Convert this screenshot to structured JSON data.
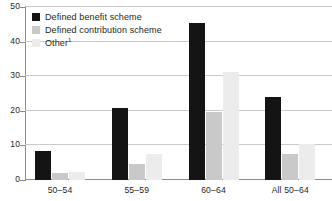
{
  "chart_data": {
    "type": "bar",
    "title": "",
    "subtitle": "",
    "xlabel": "",
    "ylabel": "",
    "ylim": [
      0,
      50
    ],
    "yticks": [
      0,
      10,
      20,
      30,
      40,
      50
    ],
    "ytick_labels": [
      "0",
      "10",
      "20",
      "30",
      "40",
      "50"
    ],
    "grid": true,
    "grid_axis": "y",
    "legend_position": "top-left",
    "categories": [
      "50–54",
      "55–59",
      "60–64",
      "All 50–64"
    ],
    "series": [
      {
        "name": "Defined benefit scheme",
        "color": "#141414",
        "values": [
          8.5,
          20.8,
          45.3,
          24.0
        ]
      },
      {
        "name": "Defined contribution scheme",
        "color": "#c9c9c9",
        "values": [
          2.0,
          4.6,
          19.7,
          7.4
        ]
      },
      {
        "name": "Other",
        "name_suffix": "1",
        "color": "#ececec",
        "values": [
          2.3,
          7.4,
          31.3,
          10.5
        ]
      }
    ]
  },
  "legend": {
    "items": [
      {
        "label": "Defined benefit scheme",
        "suffix": "",
        "swatch": "legend-swatch-dark"
      },
      {
        "label": "Defined contribution scheme",
        "suffix": "",
        "swatch": "legend-swatch-mid-gray"
      },
      {
        "label": "Other",
        "suffix": "1",
        "swatch": "legend-swatch-light-gray"
      }
    ]
  },
  "axes": {
    "y_tick_labels": [
      "50",
      "40",
      "30",
      "20",
      "10",
      "0"
    ],
    "x_tick_labels": [
      "50–54",
      "55–59",
      "60–64",
      "All 50–64"
    ]
  },
  "colors": {
    "series_defined_benefit": "#141414",
    "series_defined_contribution": "#c9c9c9",
    "series_other": "#ececec",
    "gridline": "#c9c9c9",
    "axis": "#8c8c8c",
    "text": "#231f20",
    "background": "#ffffff"
  }
}
